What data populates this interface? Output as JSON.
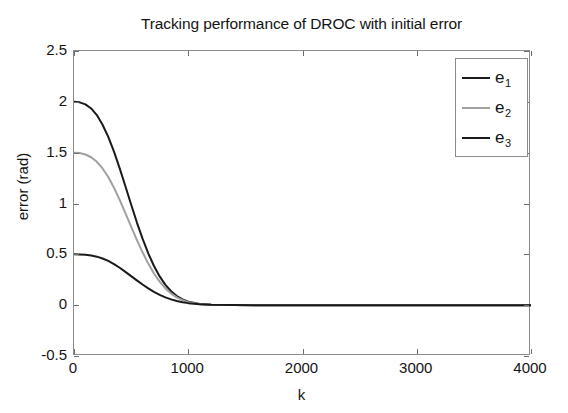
{
  "chart_data": {
    "type": "line",
    "title": "Tracking performance of DROC with initial error",
    "xlabel": "k",
    "ylabel": "error (rad)",
    "xlim": [
      0,
      4000
    ],
    "ylim": [
      -0.5,
      2.5
    ],
    "xticks": [
      0,
      1000,
      2000,
      3000,
      4000
    ],
    "xtick_labels": [
      "0",
      "1000",
      "2000",
      "3000",
      "4000"
    ],
    "yticks": [
      -0.5,
      0,
      0.5,
      1,
      1.5,
      2,
      2.5
    ],
    "ytick_labels": [
      "-0.5",
      "0",
      "0.5",
      "1",
      "1.5",
      "2",
      "2.5"
    ],
    "grid": false,
    "legend_position": "top-right",
    "series": [
      {
        "name": "e_1",
        "label": "e",
        "subscript": "1",
        "color": "#1a1a1a",
        "width": 2.0,
        "x": [
          0,
          50,
          100,
          150,
          200,
          250,
          300,
          350,
          400,
          450,
          500,
          550,
          600,
          650,
          700,
          750,
          800,
          850,
          900,
          950,
          1000,
          1100,
          1200,
          1400,
          1600,
          2000,
          2500,
          3000,
          3500,
          4000
        ],
        "y": [
          2.0,
          1.995,
          1.975,
          1.935,
          1.87,
          1.775,
          1.655,
          1.51,
          1.345,
          1.17,
          0.99,
          0.815,
          0.655,
          0.51,
          0.385,
          0.283,
          0.2,
          0.137,
          0.09,
          0.057,
          0.035,
          0.012,
          0.004,
          0.0008,
          0.0002,
          0.0,
          0.0,
          0.0,
          0.0,
          0.0
        ]
      },
      {
        "name": "e_2",
        "label": "e",
        "subscript": "2",
        "color": "#a0a0a0",
        "width": 2.0,
        "x": [
          0,
          50,
          100,
          150,
          200,
          250,
          300,
          350,
          400,
          450,
          500,
          550,
          600,
          650,
          700,
          750,
          800,
          850,
          900,
          950,
          1000,
          1100,
          1200,
          1400,
          1600,
          2000,
          2500,
          3000,
          3500,
          4000
        ],
        "y": [
          1.5,
          1.496,
          1.482,
          1.455,
          1.41,
          1.345,
          1.26,
          1.155,
          1.035,
          0.905,
          0.772,
          0.642,
          0.52,
          0.409,
          0.312,
          0.231,
          0.165,
          0.114,
          0.076,
          0.049,
          0.03,
          0.01,
          0.003,
          0.0006,
          0.0001,
          0.0,
          0.0,
          0.0,
          0.0,
          0.0
        ]
      },
      {
        "name": "e_3",
        "label": "e",
        "subscript": "3",
        "color": "#1a1a1a",
        "width": 2.0,
        "x": [
          0,
          50,
          100,
          150,
          200,
          250,
          300,
          350,
          400,
          450,
          500,
          550,
          600,
          650,
          700,
          750,
          800,
          850,
          900,
          950,
          1000,
          1100,
          1200,
          1400,
          1600,
          2000,
          2500,
          3000,
          3500,
          4000
        ],
        "y": [
          0.5,
          0.499,
          0.496,
          0.489,
          0.477,
          0.459,
          0.435,
          0.404,
          0.368,
          0.328,
          0.286,
          0.244,
          0.203,
          0.165,
          0.131,
          0.102,
          0.077,
          0.057,
          0.041,
          0.029,
          0.02,
          0.009,
          0.004,
          0.0008,
          0.0002,
          0.0,
          0.0,
          0.0,
          0.0,
          0.0
        ]
      }
    ]
  },
  "colors": {
    "axis": "#8c8c8c",
    "tick": "#6e6e6e",
    "text": "#141414",
    "background": "#ffffff"
  }
}
